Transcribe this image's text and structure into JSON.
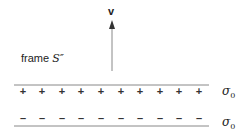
{
  "diagram": {
    "velocity_label": "v",
    "frame_label_prefix": "frame ",
    "frame_label_symbol": "S″",
    "top_sheet": {
      "charge_sign": "+",
      "count": 10,
      "sigma_symbol": "σ",
      "sigma_sub": "0"
    },
    "bottom_sheet": {
      "charge_sign": "–",
      "count": 10,
      "sigma_symbol": "σ",
      "sigma_sub": "0"
    },
    "colors": {
      "lines": "#888888",
      "arrow": "#777777",
      "text": "#222222"
    }
  }
}
